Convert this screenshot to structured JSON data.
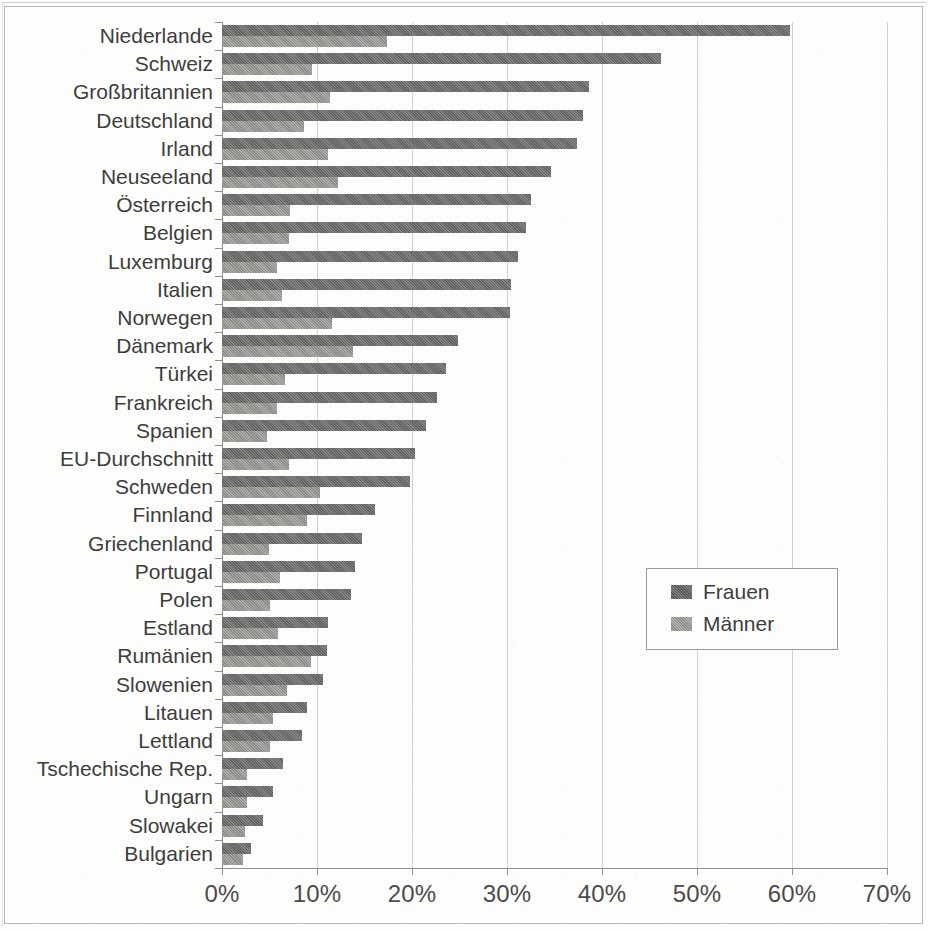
{
  "legend": {
    "items": [
      {
        "label": "Frauen",
        "color": "#6f6f6d"
      },
      {
        "label": "Männer",
        "color": "#a0a09d"
      }
    ]
  },
  "axis": {
    "x_ticks": [
      "0%",
      "10%",
      "20%",
      "30%",
      "40%",
      "50%",
      "60%",
      "70%"
    ]
  },
  "chart_data": {
    "type": "bar",
    "orientation": "horizontal",
    "title": "",
    "xlabel": "",
    "ylabel": "",
    "xlim": [
      0,
      70
    ],
    "xtick_values": [
      0,
      10,
      20,
      30,
      40,
      50,
      60,
      70
    ],
    "xtick_labels": [
      "0%",
      "10%",
      "20%",
      "30%",
      "40%",
      "50%",
      "60%",
      "70%"
    ],
    "grid": true,
    "legend_position": "center-right",
    "unit": "%",
    "categories": [
      "Niederlande",
      "Schweiz",
      "Großbritannien",
      "Deutschland",
      "Irland",
      "Neuseeland",
      "Österreich",
      "Belgien",
      "Luxemburg",
      "Italien",
      "Norwegen",
      "Dänemark",
      "Türkei",
      "Frankreich",
      "Spanien",
      "EU-Durchschnitt",
      "Schweden",
      "Finnland",
      "Griechenland",
      "Portugal",
      "Polen",
      "Estland",
      "Rumänien",
      "Slowenien",
      "Litauen",
      "Lettland",
      "Tschechische Rep.",
      "Ungarn",
      "Slowakei",
      "Bulgarien"
    ],
    "series": [
      {
        "name": "Frauen",
        "color": "#6f6f6d",
        "values": [
          59.8,
          46.2,
          38.6,
          38.0,
          37.4,
          34.6,
          32.5,
          32.0,
          31.2,
          30.4,
          30.3,
          24.8,
          23.6,
          22.6,
          21.5,
          20.3,
          19.8,
          16.1,
          14.7,
          14.0,
          13.6,
          11.2,
          11.0,
          10.6,
          8.9,
          8.4,
          6.4,
          5.4,
          4.3,
          3.1
        ]
      },
      {
        "name": "Männer",
        "color": "#a0a09d",
        "values": [
          17.4,
          9.5,
          11.4,
          8.6,
          11.2,
          12.2,
          7.2,
          7.0,
          5.8,
          6.3,
          11.6,
          13.8,
          6.6,
          5.8,
          4.7,
          7.0,
          10.3,
          8.9,
          4.9,
          6.1,
          5.0,
          5.9,
          9.4,
          6.8,
          5.4,
          5.0,
          2.6,
          2.6,
          2.4,
          2.2
        ]
      }
    ]
  }
}
